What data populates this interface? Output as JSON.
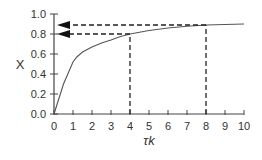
{
  "chart_data": {
    "type": "line",
    "title": "",
    "xlabel": "τk",
    "ylabel": "X",
    "xlim": [
      0,
      10
    ],
    "ylim": [
      0,
      1.0
    ],
    "xticks": [
      "0",
      "1",
      "2",
      "3",
      "4",
      "5",
      "6",
      "7",
      "8",
      "9",
      "10"
    ],
    "yticks": [
      "0.0",
      "0.2",
      "0.4",
      "0.6",
      "0.8",
      "1.0"
    ],
    "grid": false,
    "legend": null,
    "series": [
      {
        "name": "X vs τk",
        "x": [
          0,
          0.5,
          1.0,
          1.2,
          1.5,
          2,
          2.5,
          3,
          3.5,
          4,
          5,
          6,
          7,
          8,
          9,
          10
        ],
        "y": [
          0,
          0.3,
          0.52,
          0.57,
          0.62,
          0.67,
          0.71,
          0.74,
          0.775,
          0.8,
          0.835,
          0.86,
          0.878,
          0.89,
          0.895,
          0.9
        ]
      }
    ],
    "annotations": [
      {
        "type": "dashed-guide",
        "x": 4,
        "y": 0.8,
        "arrow_to": "y-axis"
      },
      {
        "type": "dashed-guide",
        "x": 8,
        "y": 0.89,
        "arrow_to": "y-axis"
      }
    ]
  },
  "labels": {
    "xlabel": "τk",
    "ylabel": "X",
    "xticks": [
      "0",
      "1",
      "2",
      "3",
      "4",
      "5",
      "6",
      "7",
      "8",
      "9",
      "10"
    ],
    "yticks": [
      "0.0",
      "0.2",
      "0.4",
      "0.6",
      "0.8",
      "1.0"
    ]
  }
}
